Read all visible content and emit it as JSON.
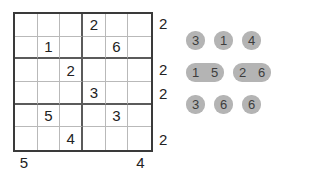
{
  "puzzle": {
    "size": 6,
    "grid": [
      [
        "",
        "",
        "",
        "2",
        "",
        ""
      ],
      [
        "",
        "1",
        "",
        "",
        "6",
        ""
      ],
      [
        "",
        "",
        "2",
        "",
        "",
        ""
      ],
      [
        "",
        "",
        "",
        "3",
        "",
        ""
      ],
      [
        "",
        "5",
        "",
        "",
        "3",
        ""
      ],
      [
        "",
        "",
        "4",
        "",
        "",
        ""
      ]
    ],
    "row_clues": [
      "2",
      "",
      "2",
      "2",
      "",
      "2"
    ],
    "column_clues": [
      "5",
      "",
      "",
      "",
      "",
      "4"
    ],
    "box_divider_columns": [
      3
    ],
    "box_divider_rows": [
      2,
      4
    ]
  },
  "tray": {
    "rows": [
      {
        "groups": [
          {
            "tiles": [
              "3"
            ]
          },
          {
            "tiles": [
              "1"
            ]
          },
          {
            "tiles": [
              "4"
            ]
          }
        ]
      },
      {
        "groups": [
          {
            "tiles": [
              "1",
              "5"
            ]
          },
          {
            "tiles": [
              "2",
              "6"
            ]
          }
        ]
      },
      {
        "groups": [
          {
            "tiles": [
              "3"
            ]
          },
          {
            "tiles": [
              "6"
            ]
          },
          {
            "tiles": [
              "6"
            ]
          }
        ]
      }
    ]
  },
  "colors": {
    "tile_fill": "#b4b4b4",
    "tile_text": "#3d3d3d",
    "grid_border": "#3a3a3a",
    "grid_line": "#b9b9b9",
    "box_line": "#5b5b5b",
    "digit": "#222222"
  }
}
